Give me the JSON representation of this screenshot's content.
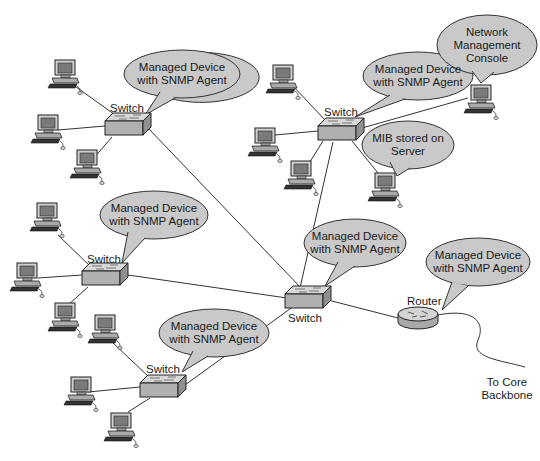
{
  "diagram": {
    "type": "network-topology",
    "colors": {
      "bubble_fill": "#c9c9c9",
      "device_fill": "#b8b8b8",
      "line": "#333333",
      "background": "#ffffff"
    },
    "switches": [
      {
        "id": "switch-a",
        "label": "Switch",
        "bubble": "Managed Device\nwith SNMP Agent",
        "bubble_line1": "Managed Device",
        "bubble_line2": "with SNMP Agent"
      },
      {
        "id": "switch-b",
        "label": "Switch",
        "bubble_line1": "Managed Device",
        "bubble_line2": "with SNMP Agent"
      },
      {
        "id": "switch-c",
        "label": "Switch",
        "bubble_line1": "Managed Device",
        "bubble_line2": "with SNMP Agent"
      },
      {
        "id": "switch-core",
        "label": "Switch",
        "bubble_line1": "Managed Device",
        "bubble_line2": "with SNMP Agent"
      },
      {
        "id": "switch-d",
        "label": "Switch",
        "bubble_line1": "Managed Device",
        "bubble_line2": "with SNMP Agent"
      }
    ],
    "router": {
      "label": "Router",
      "bubble_line1": "Managed Device",
      "bubble_line2": "with SNMP Agent"
    },
    "nmc": {
      "line1": "Network",
      "line2": "Management",
      "line3": "Console"
    },
    "mib": {
      "line1": "MIB stored on",
      "line2": "Server"
    },
    "backbone": {
      "line1": "To Core",
      "line2": "Backbone"
    }
  }
}
